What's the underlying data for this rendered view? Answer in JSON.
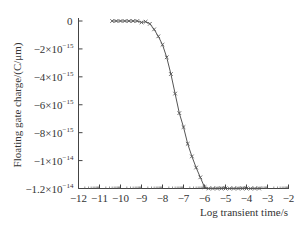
{
  "chart_data": {
    "type": "line",
    "title": "",
    "xlabel": "Log transient time/s",
    "ylabel": "Floating gate charge/(C/μm)",
    "xlim": [
      -12,
      -2
    ],
    "ylim": [
      -1.2e-14,
      0
    ],
    "grid": false,
    "legend": null,
    "x_ticks": [
      -12,
      -11,
      -10,
      -9,
      -8,
      -7,
      -6,
      -5,
      -4,
      -3,
      -2
    ],
    "x_tick_labels": [
      "−12",
      "−11",
      "−10",
      "−9",
      "−8",
      "−7",
      "−6",
      "−5",
      "−4",
      "−3",
      "−2"
    ],
    "y_ticks": [
      0,
      -2e-15,
      -4e-15,
      -6e-15,
      -8e-15,
      -1e-14,
      -1.2e-14
    ],
    "y_tick_labels": [
      {
        "mantissa": "0",
        "exp": ""
      },
      {
        "mantissa": "−2×10",
        "exp": "−15"
      },
      {
        "mantissa": "−4×10",
        "exp": "−15"
      },
      {
        "mantissa": "−6×10",
        "exp": "−15"
      },
      {
        "mantissa": "−8×10",
        "exp": "−15"
      },
      {
        "mantissa": "−1×10",
        "exp": "−14"
      },
      {
        "mantissa": "−1.2×10",
        "exp": "−14"
      }
    ],
    "series": [
      {
        "name": "floating gate charge",
        "marker": "x",
        "color": "#555555",
        "x": [
          -10.4,
          -10.2,
          -10.0,
          -9.8,
          -9.6,
          -9.4,
          -9.2,
          -9.0,
          -8.8,
          -8.6,
          -8.4,
          -8.2,
          -8.0,
          -7.8,
          -7.6,
          -7.4,
          -7.2,
          -7.0,
          -6.8,
          -6.6,
          -6.4,
          -6.2,
          -6.0,
          -5.8,
          -5.6,
          -5.4,
          -5.2,
          -5.0,
          -4.8,
          -4.6,
          -4.4,
          -4.2,
          -4.0,
          -3.8,
          -3.6,
          -3.4
        ],
        "y": [
          0,
          0,
          0,
          0,
          0,
          0,
          0,
          -1e-16,
          -5e-17,
          -2e-16,
          -6e-16,
          -1.1e-15,
          -1.7e-15,
          -2.6e-15,
          -3.8e-15,
          -5.2e-15,
          -6.6e-15,
          -7.6e-15,
          -8.8e-15,
          -9.7e-15,
          -1.05e-14,
          -1.12e-14,
          -1.19e-14,
          -1.2e-14,
          -1.2e-14,
          -1.2e-14,
          -1.2e-14,
          -1.2e-14,
          -1.2e-14,
          -1.2e-14,
          -1.2e-14,
          -1.2e-14,
          -1.2e-14,
          -1.2e-14,
          -1.2e-14,
          -1.2e-14
        ]
      }
    ]
  }
}
